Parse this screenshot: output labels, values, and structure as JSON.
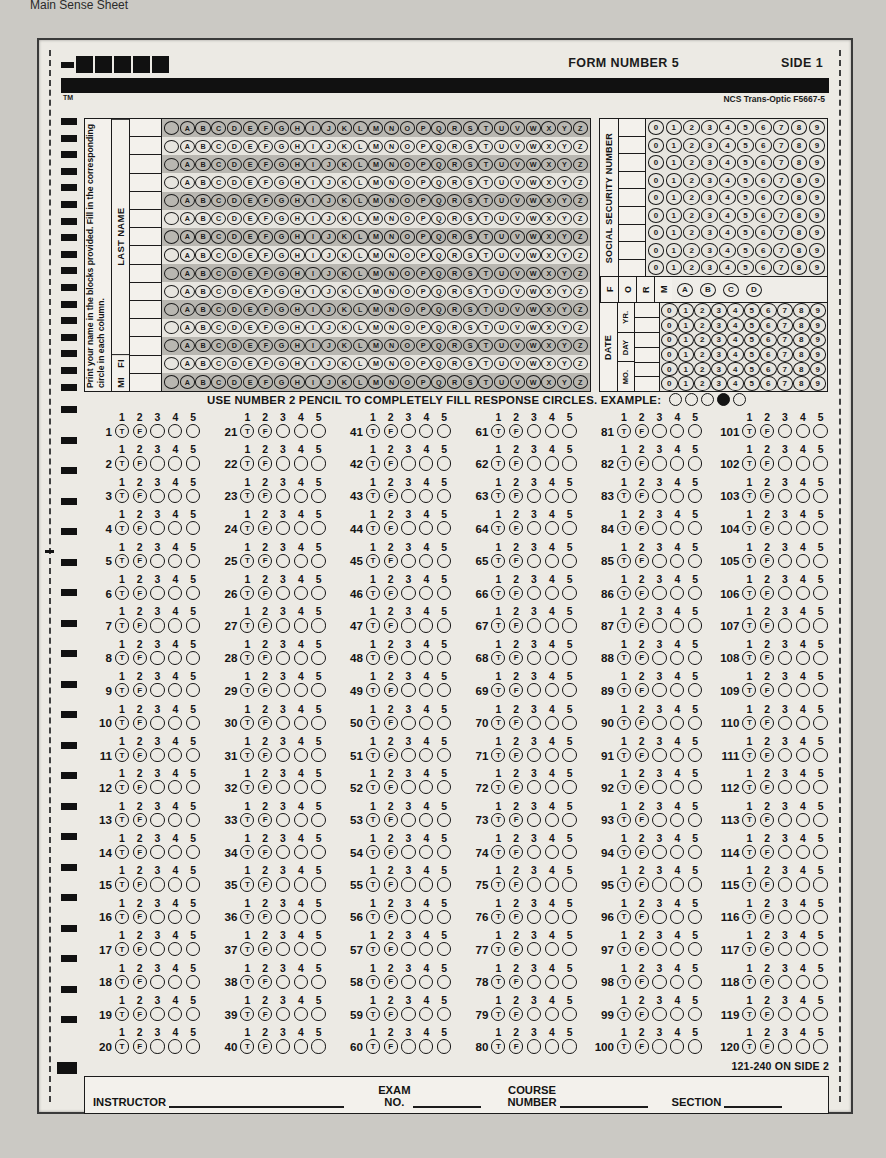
{
  "page_note": "Main Sense Sheet",
  "header": {
    "form_number": "FORM NUMBER 5",
    "side": "SIDE 1",
    "tm": "TM",
    "vendor": "NCS Trans-Optic F5667-5"
  },
  "name_section": {
    "instruction": "Print your name in the blocks provided. Fill in the corresponding circle in each column.",
    "last_name_label": "LAST NAME",
    "fi_label": "FI",
    "mi_label": "MI",
    "alphabet": [
      "A",
      "B",
      "C",
      "D",
      "E",
      "F",
      "G",
      "H",
      "I",
      "J",
      "K",
      "L",
      "M",
      "N",
      "O",
      "P",
      "Q",
      "R",
      "S",
      "T",
      "U",
      "V",
      "W",
      "X",
      "Y",
      "Z"
    ],
    "row_count": 15,
    "last_name_rows": 13,
    "blank_first_bubble": true
  },
  "ssn_section": {
    "label": "SOCIAL SECURITY NUMBER",
    "digits": [
      "0",
      "1",
      "2",
      "3",
      "4",
      "5",
      "6",
      "7",
      "8",
      "9"
    ],
    "row_count": 9
  },
  "form_section": {
    "label_letters": [
      "F",
      "O",
      "R",
      "M"
    ],
    "options": [
      "A",
      "B",
      "C",
      "D"
    ]
  },
  "date_section": {
    "label": "DATE",
    "fields": [
      {
        "label": "YR.",
        "rows": 2
      },
      {
        "label": "DAY",
        "rows": 2
      },
      {
        "label": "MO.",
        "rows": 2
      }
    ],
    "digits": [
      "0",
      "1",
      "2",
      "3",
      "4",
      "5",
      "6",
      "7",
      "8",
      "9"
    ]
  },
  "instruction_line": {
    "text": "USE NUMBER 2 PENCIL TO COMPLETELY FILL RESPONSE CIRCLES. EXAMPLE:",
    "example_bubbles": [
      false,
      false,
      false,
      true,
      false
    ]
  },
  "questions": {
    "column_headers": [
      "1",
      "2",
      "3",
      "4",
      "5"
    ],
    "bubble_labels": [
      "T",
      "F",
      "",
      "",
      ""
    ],
    "columns": [
      {
        "start": 1,
        "end": 20,
        "numbers": [
          1,
          2,
          3,
          4,
          5,
          6,
          7,
          8,
          9,
          10,
          11,
          12,
          13,
          14,
          15,
          16,
          17,
          18,
          19,
          20
        ]
      },
      {
        "start": 21,
        "end": 40,
        "numbers": [
          21,
          22,
          23,
          24,
          25,
          26,
          27,
          28,
          29,
          30,
          31,
          32,
          33,
          34,
          35,
          36,
          37,
          38,
          39,
          40
        ]
      },
      {
        "start": 41,
        "end": 60,
        "numbers": [
          41,
          42,
          43,
          44,
          45,
          46,
          47,
          48,
          49,
          50,
          51,
          52,
          53,
          54,
          55,
          56,
          57,
          58,
          59,
          60
        ]
      },
      {
        "start": 61,
        "end": 80,
        "numbers": [
          61,
          62,
          63,
          64,
          65,
          66,
          67,
          68,
          69,
          70,
          71,
          72,
          73,
          74,
          75,
          76,
          77,
          78,
          79,
          80
        ]
      },
      {
        "start": 81,
        "end": 100,
        "numbers": [
          81,
          82,
          83,
          84,
          85,
          86,
          87,
          88,
          89,
          90,
          91,
          92,
          93,
          94,
          95,
          96,
          97,
          98,
          99,
          100
        ]
      },
      {
        "start": 101,
        "end": 120,
        "numbers": [
          101,
          102,
          103,
          104,
          105,
          106,
          107,
          108,
          109,
          110,
          111,
          112,
          113,
          114,
          115,
          116,
          117,
          118,
          119,
          120
        ]
      }
    ],
    "side2_note": "121-240 ON SIDE 2"
  },
  "footer": {
    "instructor_label": "INSTRUCTOR",
    "exam_no_label_line1": "EXAM",
    "exam_no_label_line2": "NO.",
    "course_number_label_line1": "COURSE",
    "course_number_label_line2": "NUMBER",
    "section_label": "SECTION"
  },
  "colors": {
    "ink": "#141414",
    "paper": "#eceae4",
    "grid_shade": "#b9b7b1"
  }
}
